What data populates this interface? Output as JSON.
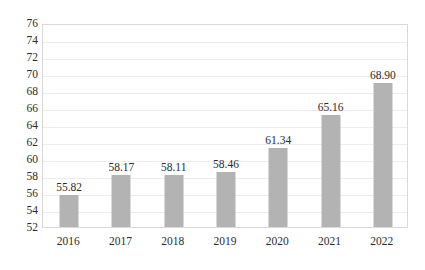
{
  "chart_data": {
    "type": "bar",
    "title": "",
    "subtitle": "",
    "xlabel": "",
    "ylabel": "",
    "categories": [
      "2016",
      "2017",
      "2018",
      "2019",
      "2020",
      "2021",
      "2022"
    ],
    "values": [
      55.82,
      58.17,
      58.11,
      58.46,
      61.34,
      65.16,
      68.9
    ],
    "data_labels": [
      "55.82",
      "58.17",
      "58.11",
      "58.46",
      "61.34",
      "65.16",
      "68.90"
    ],
    "ylim": [
      52,
      76
    ],
    "ytick_step": 2,
    "ytick_labels": [
      "76",
      "74",
      "72",
      "70",
      "68",
      "66",
      "64",
      "62",
      "60",
      "58",
      "56",
      "54",
      "52"
    ],
    "ytick_values": [
      76,
      74,
      72,
      70,
      68,
      66,
      64,
      62,
      60,
      58,
      56,
      54,
      52
    ],
    "grid": true,
    "legend": false,
    "series": [
      {
        "name": "",
        "values": [
          55.82,
          58.17,
          58.11,
          58.46,
          61.34,
          65.16,
          68.9
        ]
      }
    ],
    "colors": {
      "bar": "#b3b3b3",
      "gridline": "#ededed",
      "plot_border": "#d9d9d9",
      "text": "#2b2b2b",
      "background": "#ffffff"
    }
  }
}
